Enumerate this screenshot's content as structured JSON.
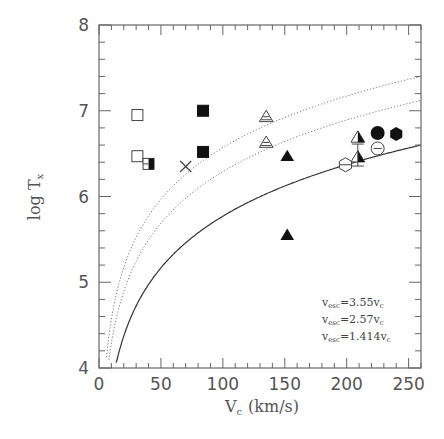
{
  "chart_data": {
    "type": "scatter",
    "title": "",
    "xlabel": "V",
    "xlabel_sub": "c",
    "xlabel_unit": "(km/s)",
    "ylabel": "log T",
    "ylabel_sub": "x",
    "xlim": [
      0,
      260
    ],
    "ylim": [
      4,
      8
    ],
    "x_ticks": [
      0,
      50,
      100,
      150,
      200,
      250
    ],
    "y_ticks": [
      4,
      5,
      6,
      7,
      8
    ],
    "grid": false,
    "points": [
      {
        "x": 31,
        "y": 6.95,
        "marker": "open-square"
      },
      {
        "x": 31,
        "y": 6.47,
        "marker": "open-square"
      },
      {
        "x": 40,
        "y": 6.38,
        "marker": "half-filled-square"
      },
      {
        "x": 70,
        "y": 6.35,
        "marker": "cross"
      },
      {
        "x": 84,
        "y": 7.0,
        "marker": "filled-square"
      },
      {
        "x": 84,
        "y": 6.52,
        "marker": "filled-square"
      },
      {
        "x": 135,
        "y": 6.93,
        "marker": "hatched-triangle"
      },
      {
        "x": 135,
        "y": 6.63,
        "marker": "hatched-triangle"
      },
      {
        "x": 152,
        "y": 6.47,
        "marker": "filled-triangle"
      },
      {
        "x": 152,
        "y": 5.55,
        "marker": "filled-triangle"
      },
      {
        "x": 199,
        "y": 6.37,
        "marker": "open-hexagon"
      },
      {
        "x": 209,
        "y": 6.69,
        "marker": "half-filled-triangle"
      },
      {
        "x": 209,
        "y": 6.46,
        "marker": "half-filled-triangle-errorbar"
      },
      {
        "x": 225,
        "y": 6.74,
        "marker": "filled-circle"
      },
      {
        "x": 225,
        "y": 6.56,
        "marker": "open-circle-minus"
      },
      {
        "x": 240,
        "y": 6.73,
        "marker": "filled-hexagon"
      }
    ],
    "series": [
      {
        "name": "v_esc=3.55v_c",
        "style": "dotted",
        "offset": 2.57
      },
      {
        "name": "v_esc=2.57v_c",
        "style": "dotted",
        "offset": 2.29
      },
      {
        "name": "v_esc=1.414v_c",
        "style": "solid",
        "offset": 1.77
      }
    ],
    "curve_formula": "log T = 2*log10(V_c) + offset",
    "legend": [
      {
        "main": "v",
        "sub": "esc",
        "rest": "=3.55v",
        "sub2": "c"
      },
      {
        "main": "v",
        "sub": "esc",
        "rest": "=2.57v",
        "sub2": "c"
      },
      {
        "main": "v",
        "sub": "esc",
        "rest": "=1.414v",
        "sub2": "c"
      }
    ],
    "legend_position": "lower right"
  }
}
